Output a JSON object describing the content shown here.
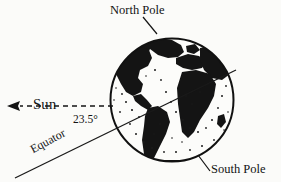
{
  "figure": {
    "background_color": "#fbfbf9",
    "ink_color": "#131313"
  },
  "labels": {
    "north_pole": "North Pole",
    "south_pole": "South Pole",
    "sun": "Sun",
    "tilt_angle": "23.5°",
    "equator": "Equator"
  },
  "globe": {
    "center_x": 172,
    "center_y": 100,
    "radius": 62,
    "outline_color": "#111111",
    "land_color": "#141414",
    "ocean_color": "#fcfcfa",
    "landmasses": [
      "North America",
      "Greenland",
      "South America",
      "Europe",
      "Africa",
      "Asia"
    ]
  },
  "annotations": {
    "sun_ray": {
      "style": "dashed",
      "direction": "left",
      "arrowhead": true,
      "y": 106,
      "x_start": 113,
      "x_end": 8
    },
    "equator_line": {
      "style": "solid",
      "x_start": 15,
      "y_start": 178,
      "x_end": 236,
      "y_end": 70,
      "angle_degrees": 23.5
    },
    "north_pole_leader": {
      "x_start": 144,
      "y_start": 18,
      "x_end": 157,
      "y_end": 34
    },
    "south_pole_leader": {
      "x_start": 209,
      "y_start": 170,
      "x_end": 198,
      "y_end": 156
    }
  }
}
